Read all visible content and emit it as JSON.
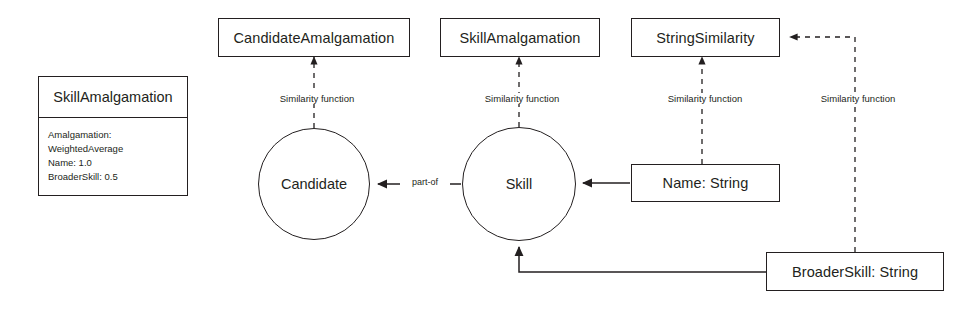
{
  "diagram": {
    "stroke_color": "#231f20",
    "background_color": "#ffffff",
    "amalgamation_box": {
      "title": "SkillAmalgamation",
      "attributes": [
        "Amalgamation:",
        "WeightedAverage",
        "Name: 1.0",
        "BroaderSkill: 0.5"
      ]
    },
    "nodes": {
      "candidate_amalgamation": "CandidateAmalgamation",
      "skill_amalgamation": "SkillAmalgamation",
      "string_similarity": "StringSimilarity",
      "candidate": "Candidate",
      "skill": "Skill",
      "name_string": "Name: String",
      "broader_skill_string": "BroaderSkill: String"
    },
    "edge_labels": {
      "similarity_candidate": "Similarity function",
      "similarity_skill": "Similarity function",
      "similarity_name": "Similarity function",
      "similarity_broader_skill": "Similarity function",
      "part_of": "part-of"
    }
  }
}
